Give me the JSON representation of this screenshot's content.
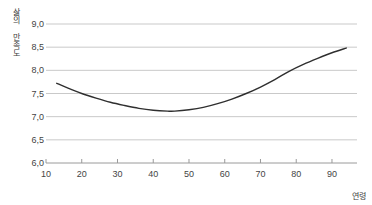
{
  "chart_data": {
    "type": "line",
    "title": "",
    "subtitle": "",
    "xlabel": "연령",
    "ylabel": "삶의 만족도",
    "xlim": [
      10,
      97
    ],
    "ylim": [
      6.0,
      9.0
    ],
    "grid": true,
    "legend": null,
    "xticks": [
      10,
      20,
      30,
      40,
      50,
      60,
      70,
      80,
      90
    ],
    "xtick_labels": [
      "10",
      "20",
      "30",
      "40",
      "50",
      "60",
      "70",
      "80",
      "90"
    ],
    "yticks": [
      6.0,
      6.5,
      7.0,
      7.5,
      8.0,
      8.5,
      9.0
    ],
    "ytick_labels": [
      "6,0",
      "6,5",
      "7,0",
      "7,5",
      "8,0",
      "8,5",
      "9,0"
    ],
    "line_color": "#2f2f2f",
    "grid_color": "#c9c9c9",
    "series": [
      {
        "name": "삶의 만족도",
        "x": [
          13,
          16,
          20,
          24,
          28,
          32,
          36,
          40,
          44,
          46,
          50,
          54,
          58,
          62,
          66,
          70,
          74,
          78,
          82,
          86,
          90,
          94
        ],
        "values": [
          7.72,
          7.62,
          7.5,
          7.4,
          7.31,
          7.24,
          7.18,
          7.14,
          7.12,
          7.12,
          7.15,
          7.2,
          7.28,
          7.38,
          7.5,
          7.64,
          7.8,
          7.98,
          8.13,
          8.26,
          8.38,
          8.48
        ]
      }
    ],
    "annotations": []
  }
}
